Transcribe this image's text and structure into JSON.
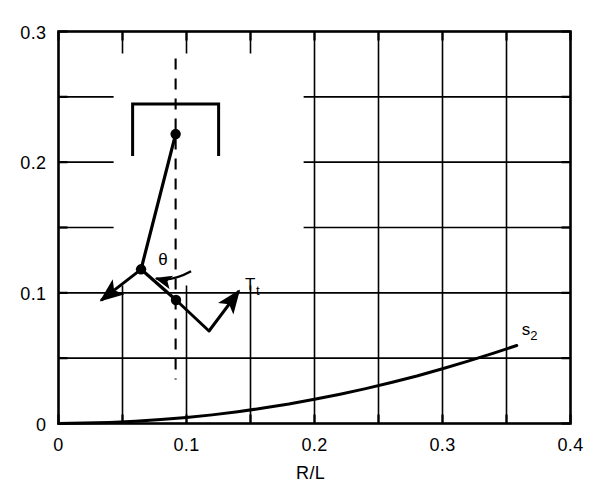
{
  "chart_data": {
    "type": "line",
    "title": "",
    "xlabel": "R/L",
    "ylabel": "",
    "xlim": [
      0,
      0.4
    ],
    "ylim": [
      0,
      0.3
    ],
    "grid": true,
    "grid_step_x": 0.05,
    "grid_step_y": 0.05,
    "legend": "none",
    "xticks": [
      {
        "value": 0,
        "label": "0"
      },
      {
        "value": 0.05,
        "label": ""
      },
      {
        "value": 0.1,
        "label": "0.1"
      },
      {
        "value": 0.15,
        "label": ""
      },
      {
        "value": 0.2,
        "label": "0.2"
      },
      {
        "value": 0.25,
        "label": ""
      },
      {
        "value": 0.3,
        "label": "0.3"
      },
      {
        "value": 0.35,
        "label": ""
      },
      {
        "value": 0.4,
        "label": "0.4"
      }
    ],
    "yticks": [
      {
        "value": 0,
        "label": "0"
      },
      {
        "value": 0.05,
        "label": ""
      },
      {
        "value": 0.1,
        "label": "0.1"
      },
      {
        "value": 0.15,
        "label": ""
      },
      {
        "value": 0.2,
        "label": "0.2"
      },
      {
        "value": 0.25,
        "label": ""
      },
      {
        "value": 0.3,
        "label": "0.3"
      }
    ],
    "series": [
      {
        "name": "s2",
        "annotation": "s₂",
        "annotation_x": 0.368,
        "annotation_y": 0.068,
        "x": [
          0.0,
          0.02,
          0.04,
          0.06,
          0.08,
          0.1,
          0.12,
          0.14,
          0.16,
          0.18,
          0.2,
          0.22,
          0.24,
          0.26,
          0.28,
          0.3,
          0.32,
          0.34,
          0.358
        ],
        "values": [
          0.0,
          0.0003,
          0.0008,
          0.0017,
          0.003,
          0.0046,
          0.0066,
          0.009,
          0.0118,
          0.0149,
          0.0185,
          0.0224,
          0.0267,
          0.0314,
          0.0364,
          0.0419,
          0.0477,
          0.0539,
          0.0597
        ]
      }
    ],
    "inset": {
      "name": "blade-tip-schematic",
      "theta_label": "θ",
      "force_label": "T",
      "force_subscript": "t",
      "nodes": [
        {
          "name": "pivot-node",
          "x": 0.0915,
          "y": 0.2215
        },
        {
          "name": "mid-node",
          "x": 0.0645,
          "y": 0.118
        },
        {
          "name": "lower-node",
          "x": 0.0918,
          "y": 0.0945
        }
      ]
    }
  },
  "colors": {
    "ink": "#000000",
    "background": "#ffffff",
    "grid": "#1a1a1a"
  }
}
